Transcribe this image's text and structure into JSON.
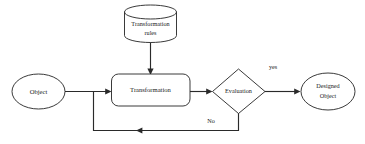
{
  "diagram": {
    "background_color": "#ffffff",
    "stroke_color": "#242424",
    "text_color": "#1a1a1a",
    "nodes": {
      "rules_store": {
        "label_line1": "Transformation",
        "label_line2": "rules",
        "shape": "cylinder"
      },
      "input_object": {
        "label": "Object",
        "shape": "ellipse"
      },
      "transformation": {
        "label": "Transformation",
        "shape": "rounded-rectangle"
      },
      "evaluation": {
        "label": "Evaluation",
        "shape": "diamond"
      },
      "designed_object": {
        "label_line1": "Designed",
        "label_line2": "Object",
        "shape": "ellipse"
      }
    },
    "edges": {
      "yes_label": "yes",
      "no_label": "No"
    }
  }
}
